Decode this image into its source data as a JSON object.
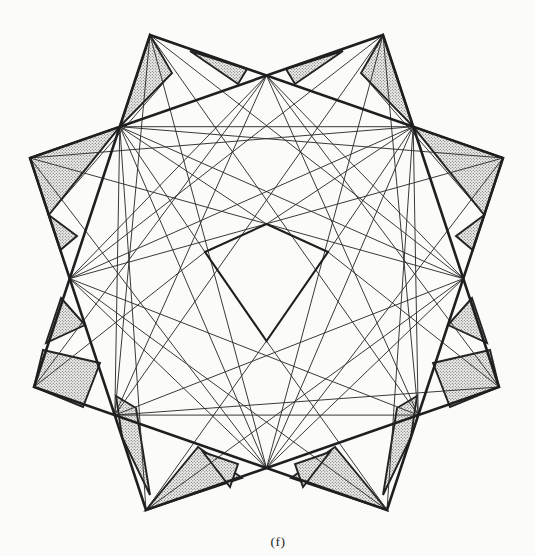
{
  "figure": {
    "caption": "(f)",
    "canvas": {
      "width": 535,
      "height": 556
    },
    "colors": {
      "paper": "#fbfbf9",
      "thick_line": "#1f1f1f",
      "thin_line": "#2e2e2e",
      "shaded_border": "#222222",
      "stipple_dot": "#4a4a4a",
      "stipple_bg": "#efeeea",
      "caption_color": "#1c1c1c"
    },
    "stroke_widths": {
      "square": 2.6,
      "kite": 2.1,
      "shaded": 1.9,
      "thin": 0.95
    },
    "geometry": {
      "thick_polygons": [
        [
          [
            150,
            35
          ],
          [
            503,
            158
          ],
          [
            387,
            510
          ],
          [
            34,
            387
          ]
        ],
        [
          [
            383,
            35
          ],
          [
            499,
            387
          ],
          [
            146,
            510
          ],
          [
            30,
            158
          ]
        ]
      ],
      "kite": [
        [
          266.5,
          224
        ],
        [
          328,
          252
        ],
        [
          266.5,
          341
        ],
        [
          205,
          252
        ]
      ],
      "thin_segments": [
        [
          266.5,
          75.6,
          463.3,
          278.6
        ],
        [
          266.5,
          75.6,
          69.7,
          278.6
        ],
        [
          266.5,
          75.6,
          114.8,
          415.1
        ],
        [
          266.5,
          75.6,
          418.2,
          415.1
        ],
        [
          266.5,
          468,
          413.2,
          126.7
        ],
        [
          266.5,
          468,
          119.8,
          126.7
        ],
        [
          266.5,
          468,
          463.3,
          278.6
        ],
        [
          266.5,
          468,
          69.7,
          278.6
        ],
        [
          463.3,
          278.6,
          119.8,
          126.7
        ],
        [
          69.7,
          278.6,
          413.2,
          126.7
        ],
        [
          463.3,
          278.6,
          114.8,
          415.1
        ],
        [
          69.7,
          278.6,
          418.2,
          415.1
        ],
        [
          413.2,
          126.7,
          119.8,
          126.7
        ],
        [
          114.8,
          415.1,
          418.2,
          415.1
        ],
        [
          413.2,
          126.7,
          418.2,
          415.1
        ],
        [
          119.8,
          126.7,
          114.8,
          415.1
        ],
        [
          119.8,
          126.7,
          503,
          158
        ],
        [
          119.8,
          126.7,
          146,
          510
        ],
        [
          119.8,
          126.7,
          266.5,
          224
        ],
        [
          328,
          252,
          499,
          387
        ],
        [
          119.8,
          126.7,
          205,
          252
        ],
        [
          266.5,
          341,
          387,
          510
        ],
        [
          413.2,
          126.7,
          30,
          158
        ],
        [
          413.2,
          126.7,
          387,
          510
        ],
        [
          413.2,
          126.7,
          266.5,
          224
        ],
        [
          205,
          252,
          34,
          387
        ],
        [
          413.2,
          126.7,
          328,
          252
        ],
        [
          266.5,
          341,
          146,
          510
        ],
        [
          114.8,
          415.1,
          150,
          35
        ],
        [
          114.8,
          415.1,
          383,
          35
        ],
        [
          114.8,
          415.1,
          499,
          387
        ],
        [
          418.2,
          415.1,
          383,
          35
        ],
        [
          418.2,
          415.1,
          150,
          35
        ],
        [
          418.2,
          415.1,
          503,
          158
        ],
        [
          266.5,
          75.6,
          34,
          387
        ],
        [
          266.5,
          75.6,
          499,
          387
        ],
        [
          266.5,
          468,
          150,
          35
        ],
        [
          266.5,
          468,
          383,
          35
        ],
        [
          266.5,
          468,
          503,
          158
        ],
        [
          266.5,
          468,
          30,
          158
        ],
        [
          69.7,
          278.6,
          503,
          158
        ],
        [
          69.7,
          278.6,
          387,
          510
        ],
        [
          69.7,
          278.6,
          383,
          35
        ],
        [
          463.3,
          278.6,
          30,
          158
        ],
        [
          463.3,
          278.6,
          146,
          510
        ],
        [
          463.3,
          278.6,
          150,
          35
        ],
        [
          172,
          73,
          48.7,
          215
        ],
        [
          361,
          73,
          484.3,
          215
        ]
      ],
      "shaded_polygons": [
        [
          [
            150,
            35
          ],
          [
            172,
            73
          ],
          [
            119.8,
            126.7
          ]
        ],
        [
          [
            383,
            35
          ],
          [
            361,
            73
          ],
          [
            413.2,
            126.7
          ]
        ],
        [
          [
            190,
            51
          ],
          [
            247,
            69
          ],
          [
            238,
            84
          ]
        ],
        [
          [
            343,
            51
          ],
          [
            286,
            69
          ],
          [
            295,
            84
          ]
        ],
        [
          [
            30,
            158
          ],
          [
            119.8,
            126.7
          ],
          [
            48.7,
            215
          ]
        ],
        [
          [
            503,
            158
          ],
          [
            413.2,
            126.7
          ],
          [
            484.3,
            215
          ]
        ],
        [
          [
            48.7,
            215
          ],
          [
            77,
            236
          ],
          [
            60.3,
            250
          ]
        ],
        [
          [
            484.3,
            215
          ],
          [
            456,
            236
          ],
          [
            472.7,
            250
          ]
        ],
        [
          [
            61,
            298
          ],
          [
            85,
            325
          ],
          [
            46,
            343
          ]
        ],
        [
          [
            472,
            298
          ],
          [
            448,
            325
          ],
          [
            487,
            343
          ]
        ],
        [
          [
            43,
            350
          ],
          [
            100,
            363
          ],
          [
            83,
            407
          ],
          [
            34,
            387
          ]
        ],
        [
          [
            490,
            350
          ],
          [
            433,
            363
          ],
          [
            450,
            407
          ],
          [
            499,
            387
          ]
        ],
        [
          [
            116,
            396
          ],
          [
            136,
            408
          ],
          [
            150,
            495
          ],
          [
            122,
            437
          ]
        ],
        [
          [
            417,
            396
          ],
          [
            397,
            408
          ],
          [
            383,
            495
          ],
          [
            411,
            437
          ]
        ],
        [
          [
            146,
            510
          ],
          [
            198,
            447
          ],
          [
            242,
            478
          ]
        ],
        [
          [
            387,
            510
          ],
          [
            335,
            447
          ],
          [
            291,
            478
          ]
        ],
        [
          [
            203,
            452
          ],
          [
            238,
            464
          ],
          [
            230,
            487
          ]
        ],
        [
          [
            330,
            452
          ],
          [
            295,
            464
          ],
          [
            303,
            487
          ]
        ]
      ]
    }
  }
}
